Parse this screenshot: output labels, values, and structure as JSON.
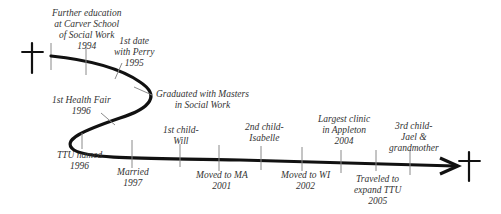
{
  "diagram": {
    "type": "life-timeline",
    "colors": {
      "line": "#111111",
      "tick": "#8a8a8a",
      "text": "#333333",
      "background": "#ffffff"
    },
    "start_symbol": "cross-icon",
    "end_symbol": "cross-icon",
    "events": [
      {
        "id": "further-education",
        "lines": [
          "Further education",
          "at Carver School",
          "of Social Work",
          "1994"
        ]
      },
      {
        "id": "first-date",
        "lines": [
          "1st date",
          "with Perry",
          "1995"
        ]
      },
      {
        "id": "graduated",
        "lines": [
          "Graduated with Masters",
          "in Social Work"
        ]
      },
      {
        "id": "health-fair",
        "lines": [
          "1st Health Fair",
          "1996"
        ]
      },
      {
        "id": "ttu-named",
        "lines": [
          "TTU named",
          "1996"
        ]
      },
      {
        "id": "married",
        "lines": [
          "Married",
          "1997"
        ]
      },
      {
        "id": "first-child",
        "lines": [
          "1st child-",
          "Will"
        ]
      },
      {
        "id": "moved-ma",
        "lines": [
          "Moved to MA",
          "2001"
        ]
      },
      {
        "id": "second-child",
        "lines": [
          "2nd child-",
          "Isabelle"
        ]
      },
      {
        "id": "moved-wi",
        "lines": [
          "Moved to WI",
          "2002"
        ]
      },
      {
        "id": "largest-clinic",
        "lines": [
          "Largest clinic",
          "in Appleton",
          "2004"
        ]
      },
      {
        "id": "traveled",
        "lines": [
          "Traveled to",
          "expand TTU",
          "2005"
        ]
      },
      {
        "id": "third-child",
        "lines": [
          "3rd child-",
          "Jael &",
          "grandmother"
        ]
      }
    ]
  }
}
